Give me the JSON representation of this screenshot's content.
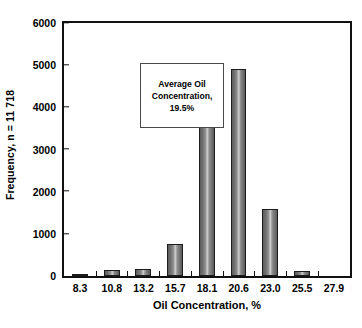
{
  "chart_data": {
    "type": "bar",
    "title": "",
    "subtitle": "",
    "xlabel": "Oil Concentration, %",
    "ylabel": "Frequency, n = 11 718",
    "categories": [
      "8.3",
      "10.8",
      "13.2",
      "15.7",
      "18.1",
      "20.6",
      "23.0",
      "25.5",
      "27.9"
    ],
    "values": [
      30,
      150,
      170,
      760,
      4060,
      4920,
      1580,
      120,
      0
    ],
    "ylim": [
      0,
      6000
    ],
    "ytick_labels": [
      "0",
      "1000",
      "2000",
      "3000",
      "4000",
      "5000",
      "6000"
    ],
    "ytick_values": [
      0,
      1000,
      2000,
      3000,
      4000,
      5000,
      6000
    ],
    "grid": false,
    "legend": "none",
    "bar_color": "#808080",
    "bar_border_color": "#1c1c1c",
    "axis_color": "#111111",
    "background_color": "#ffffff",
    "annotations": [
      {
        "name": "average-oil-concentration-note",
        "lines": [
          "Average Oil",
          "Concentration,",
          "19.5%"
        ]
      }
    ]
  },
  "annotation": {
    "line1": "Average Oil",
    "line2": "Concentration,",
    "line3": "19.5%"
  }
}
